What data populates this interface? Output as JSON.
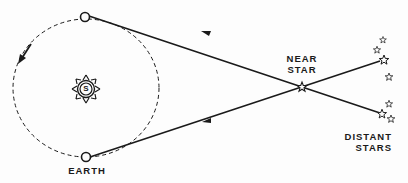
{
  "diagram": {
    "type": "stellar-parallax",
    "colors": {
      "ink": "#1a1a1a",
      "background": "#fdfdfd"
    },
    "labels": {
      "earth": "EARTH",
      "sun": "S",
      "near_star_line1": "NEAR",
      "near_star_line2": "STAR",
      "distant_stars_line1": "DISTANT",
      "distant_stars_line2": "STARS"
    },
    "nodes": [
      {
        "id": "sun",
        "label": "S"
      },
      {
        "id": "earth-top",
        "label": ""
      },
      {
        "id": "earth-bottom",
        "label": "EARTH"
      },
      {
        "id": "near-star",
        "label": "NEAR STAR"
      },
      {
        "id": "distant-stars",
        "label": "DISTANT STARS"
      }
    ],
    "edges": [
      {
        "from": "distant-stars",
        "to": "earth-top",
        "via": "near-star",
        "arrow": "toward-earth"
      },
      {
        "from": "distant-stars",
        "to": "earth-bottom",
        "via": "near-star",
        "arrow": "toward-earth"
      }
    ],
    "orbit": {
      "style": "dashed",
      "direction": "counterclockwise"
    }
  }
}
